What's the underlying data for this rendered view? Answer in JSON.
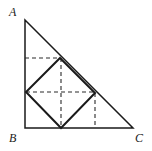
{
  "figure": {
    "canvas": {
      "width": 152,
      "height": 151,
      "background": "#ffffff"
    },
    "stroke": {
      "solid_color": "#1a1a1a",
      "dashed_color": "#2b2b2b",
      "triangle_width": 1.5,
      "square_width": 2.0,
      "dashed_width": 1.1,
      "dash_pattern": "4,3"
    },
    "labels": [
      {
        "id": "A",
        "text": "A",
        "x": 9,
        "y": 6
      },
      {
        "id": "B",
        "text": "B",
        "x": 9,
        "y": 132
      },
      {
        "id": "C",
        "text": "C",
        "x": 135,
        "y": 132
      }
    ],
    "points": {
      "A": {
        "x": 25,
        "y": 20
      },
      "B": {
        "x": 25,
        "y": 128
      },
      "C": {
        "x": 133,
        "y": 128
      },
      "square_top": {
        "x": 60,
        "y": 58
      },
      "square_left": {
        "x": 26,
        "y": 92
      },
      "square_bottom": {
        "x": 61,
        "y": 128
      },
      "square_right": {
        "x": 95,
        "y": 93
      },
      "foot_right": {
        "x": 95,
        "y": 128
      },
      "foot_top_left": {
        "x": 25,
        "y": 58
      }
    },
    "triangle": {
      "name": "triangle-ABC",
      "path": "M 25 20 L 25 128 L 133 128 Z"
    },
    "inscribed_square": {
      "name": "inscribed-square",
      "path": "M 60 58 L 95 93 L 61 128 L 26 92 Z"
    },
    "dashed_segments": [
      {
        "name": "dashed-horizontal-upper",
        "x1": 25,
        "y1": 58,
        "x2": 60,
        "y2": 58
      },
      {
        "name": "dashed-diagonal-horizontal",
        "x1": 26,
        "y1": 92,
        "x2": 95,
        "y2": 92
      },
      {
        "name": "dashed-diagonal-vertical",
        "x1": 61,
        "y1": 58,
        "x2": 61,
        "y2": 128
      },
      {
        "name": "dashed-vertical-right",
        "x1": 95,
        "y1": 93,
        "x2": 95,
        "y2": 128
      }
    ]
  }
}
